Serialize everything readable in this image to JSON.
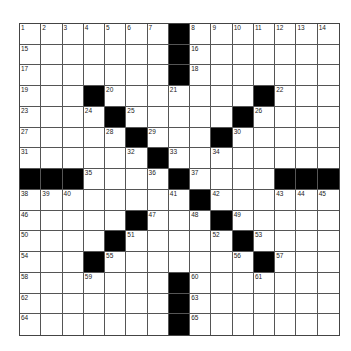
{
  "puzzle": {
    "rows": 15,
    "cols": 15,
    "colors": {
      "block": "#000000",
      "cell": "#ffffff",
      "line": "#555555"
    },
    "blocks": [
      [
        0,
        7
      ],
      [
        1,
        7
      ],
      [
        2,
        7
      ],
      [
        3,
        3
      ],
      [
        3,
        11
      ],
      [
        4,
        4
      ],
      [
        4,
        10
      ],
      [
        5,
        5
      ],
      [
        5,
        9
      ],
      [
        6,
        6
      ],
      [
        7,
        0
      ],
      [
        7,
        1
      ],
      [
        7,
        2
      ],
      [
        7,
        7
      ],
      [
        7,
        12
      ],
      [
        7,
        13
      ],
      [
        7,
        14
      ],
      [
        8,
        8
      ],
      [
        9,
        5
      ],
      [
        9,
        9
      ],
      [
        10,
        4
      ],
      [
        10,
        10
      ],
      [
        11,
        3
      ],
      [
        11,
        11
      ],
      [
        12,
        7
      ],
      [
        13,
        7
      ],
      [
        14,
        7
      ]
    ],
    "numbers": [
      {
        "r": 0,
        "c": 0,
        "n": "1"
      },
      {
        "r": 0,
        "c": 1,
        "n": "2"
      },
      {
        "r": 0,
        "c": 2,
        "n": "3"
      },
      {
        "r": 0,
        "c": 3,
        "n": "4"
      },
      {
        "r": 0,
        "c": 4,
        "n": "5"
      },
      {
        "r": 0,
        "c": 5,
        "n": "6"
      },
      {
        "r": 0,
        "c": 6,
        "n": "7"
      },
      {
        "r": 0,
        "c": 8,
        "n": "8"
      },
      {
        "r": 0,
        "c": 9,
        "n": "9"
      },
      {
        "r": 0,
        "c": 10,
        "n": "10"
      },
      {
        "r": 0,
        "c": 11,
        "n": "11"
      },
      {
        "r": 0,
        "c": 12,
        "n": "12"
      },
      {
        "r": 0,
        "c": 13,
        "n": "13"
      },
      {
        "r": 0,
        "c": 14,
        "n": "14"
      },
      {
        "r": 1,
        "c": 0,
        "n": "15"
      },
      {
        "r": 1,
        "c": 8,
        "n": "16"
      },
      {
        "r": 2,
        "c": 0,
        "n": "17"
      },
      {
        "r": 2,
        "c": 8,
        "n": "18"
      },
      {
        "r": 3,
        "c": 0,
        "n": "19"
      },
      {
        "r": 3,
        "c": 4,
        "n": "20"
      },
      {
        "r": 3,
        "c": 7,
        "n": "21"
      },
      {
        "r": 3,
        "c": 12,
        "n": "22"
      },
      {
        "r": 4,
        "c": 0,
        "n": "23"
      },
      {
        "r": 4,
        "c": 3,
        "n": "24"
      },
      {
        "r": 4,
        "c": 5,
        "n": "25"
      },
      {
        "r": 4,
        "c": 11,
        "n": "26"
      },
      {
        "r": 5,
        "c": 0,
        "n": "27"
      },
      {
        "r": 5,
        "c": 4,
        "n": "28"
      },
      {
        "r": 5,
        "c": 6,
        "n": "29"
      },
      {
        "r": 5,
        "c": 10,
        "n": "30"
      },
      {
        "r": 6,
        "c": 0,
        "n": "31"
      },
      {
        "r": 6,
        "c": 5,
        "n": "32"
      },
      {
        "r": 6,
        "c": 7,
        "n": "33"
      },
      {
        "r": 6,
        "c": 9,
        "n": "34"
      },
      {
        "r": 7,
        "c": 3,
        "n": "35"
      },
      {
        "r": 7,
        "c": 6,
        "n": "36"
      },
      {
        "r": 7,
        "c": 8,
        "n": "37"
      },
      {
        "r": 8,
        "c": 0,
        "n": "38"
      },
      {
        "r": 8,
        "c": 1,
        "n": "39"
      },
      {
        "r": 8,
        "c": 2,
        "n": "40"
      },
      {
        "r": 8,
        "c": 7,
        "n": "41"
      },
      {
        "r": 8,
        "c": 9,
        "n": "42"
      },
      {
        "r": 8,
        "c": 12,
        "n": "43"
      },
      {
        "r": 8,
        "c": 13,
        "n": "44"
      },
      {
        "r": 8,
        "c": 14,
        "n": "45"
      },
      {
        "r": 9,
        "c": 0,
        "n": "46"
      },
      {
        "r": 9,
        "c": 6,
        "n": "47"
      },
      {
        "r": 9,
        "c": 8,
        "n": "48"
      },
      {
        "r": 9,
        "c": 10,
        "n": "49"
      },
      {
        "r": 10,
        "c": 0,
        "n": "50"
      },
      {
        "r": 10,
        "c": 5,
        "n": "51"
      },
      {
        "r": 10,
        "c": 9,
        "n": "52"
      },
      {
        "r": 10,
        "c": 11,
        "n": "53"
      },
      {
        "r": 11,
        "c": 0,
        "n": "54"
      },
      {
        "r": 11,
        "c": 4,
        "n": "55"
      },
      {
        "r": 11,
        "c": 10,
        "n": "56"
      },
      {
        "r": 11,
        "c": 12,
        "n": "57"
      },
      {
        "r": 12,
        "c": 0,
        "n": "58"
      },
      {
        "r": 12,
        "c": 3,
        "n": "59"
      },
      {
        "r": 12,
        "c": 8,
        "n": "60"
      },
      {
        "r": 12,
        "c": 11,
        "n": "61"
      },
      {
        "r": 13,
        "c": 0,
        "n": "62"
      },
      {
        "r": 13,
        "c": 8,
        "n": "63"
      },
      {
        "r": 14,
        "c": 0,
        "n": "64"
      },
      {
        "r": 14,
        "c": 8,
        "n": "65"
      }
    ]
  }
}
